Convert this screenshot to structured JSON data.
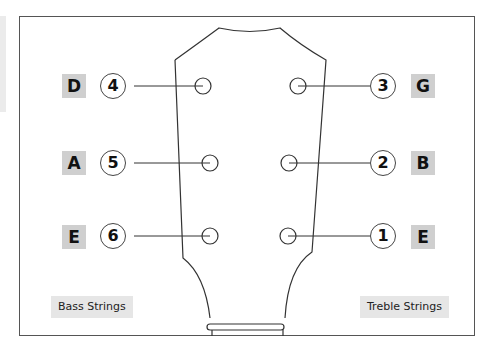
{
  "diagram": {
    "type": "guitar-headstock-tuning",
    "bass_side": {
      "label": "Bass Strings",
      "strings": [
        {
          "number": "4",
          "note": "D"
        },
        {
          "number": "5",
          "note": "A"
        },
        {
          "number": "6",
          "note": "E"
        }
      ]
    },
    "treble_side": {
      "label": "Treble Strings",
      "strings": [
        {
          "number": "3",
          "note": "G"
        },
        {
          "number": "2",
          "note": "B"
        },
        {
          "number": "1",
          "note": "E"
        }
      ]
    },
    "colors": {
      "letter_box": "#cfcfcf",
      "caption_box": "#e6e6e6",
      "outline": "#333333"
    }
  }
}
